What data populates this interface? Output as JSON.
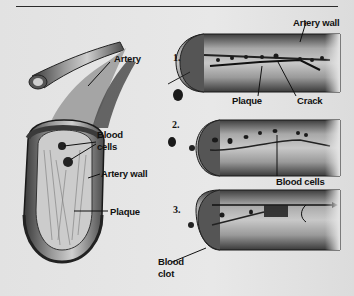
{
  "figure": {
    "type": "medical illustration"
  },
  "left_panel": {
    "labels": {
      "artery": "Artery",
      "blood_cells": "Blood cells",
      "blood_cells_line1": "Blood",
      "blood_cells_line2": "cells",
      "artery_wall": "Artery wall",
      "plaque": "Plaque"
    }
  },
  "right_panel": {
    "steps": [
      {
        "number": "1.",
        "labels": {
          "artery_wall": "Artery wall",
          "plaque": "Plaque",
          "crack": "Crack"
        }
      },
      {
        "number": "2.",
        "labels": {
          "blood_cells": "Blood cells"
        }
      },
      {
        "number": "3.",
        "labels": {
          "blood_clot_line1": "Blood",
          "blood_clot_line2": "clot"
        }
      }
    ]
  },
  "colors": {
    "background": "#e6e6e6",
    "ink": "#111111",
    "vessel_dark": "#3a3a3a",
    "vessel_mid": "#8a8a8a",
    "vessel_light": "#d4d4d4"
  }
}
